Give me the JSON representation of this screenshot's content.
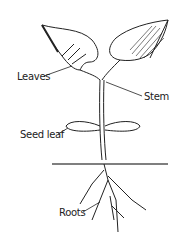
{
  "diagram": {
    "type": "plant-anatomy",
    "labels": {
      "leaves": "Leaves",
      "stem": "Stem",
      "seed_leaf": "Seed leaf",
      "roots": "Roots"
    },
    "colors": {
      "line": "#222222",
      "background": "#ffffff",
      "soil": "#555555"
    }
  }
}
